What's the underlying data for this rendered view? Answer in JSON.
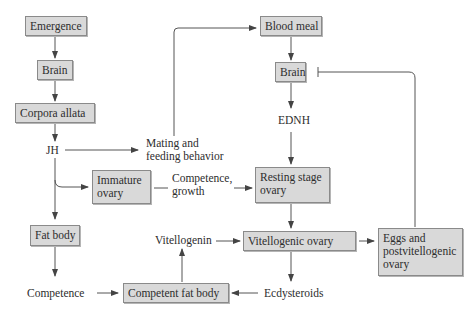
{
  "diagram": {
    "type": "flowchart",
    "boxes": {
      "emergence": "Emergence",
      "brain_left": "Brain",
      "corpora_allata": "Corpora allata",
      "fat_body": "Fat body",
      "immature_ovary": [
        "Immature",
        "ovary"
      ],
      "blood_meal": "Blood meal",
      "brain_right": "Brain",
      "resting_ovary": [
        "Resting stage",
        "ovary"
      ],
      "vitellogenic_ovary": "Vitellogenic ovary",
      "eggs": [
        "Eggs and",
        "postvitellogenic",
        "ovary"
      ],
      "competent_fat_body": "Competent fat body"
    },
    "labels": {
      "jh": "JH",
      "mating": [
        "Mating and",
        "feeding behavior"
      ],
      "ednh": "EDNH",
      "competence_growth": [
        "Competence,",
        "growth"
      ],
      "vitellogenin": "Vitellogenin",
      "competence": "Competence",
      "ecdysteroids": "Ecdysteroids"
    },
    "edges": [
      {
        "from": "Emergence",
        "to": "Brain (left)",
        "type": "arrow"
      },
      {
        "from": "Brain (left)",
        "to": "Corpora allata",
        "type": "arrow"
      },
      {
        "from": "Corpora allata",
        "to": "JH",
        "type": "arrow"
      },
      {
        "from": "JH",
        "to": "Mating and feeding behavior",
        "type": "arrow"
      },
      {
        "from": "Mating and feeding behavior",
        "to": "Blood meal",
        "type": "arrow"
      },
      {
        "from": "JH",
        "to": "Immature ovary",
        "type": "arrow"
      },
      {
        "from": "JH",
        "to": "Fat body",
        "type": "arrow"
      },
      {
        "from": "Fat body",
        "to": "Competence",
        "type": "arrow"
      },
      {
        "from": "Competence",
        "to": "Competent fat body",
        "type": "arrow"
      },
      {
        "from": "Immature ovary",
        "to": "Resting stage ovary",
        "via": "Competence, growth",
        "type": "arrow"
      },
      {
        "from": "Blood meal",
        "to": "Brain (right)",
        "type": "arrow"
      },
      {
        "from": "Brain (right)",
        "to": "EDNH",
        "type": "arrow"
      },
      {
        "from": "EDNH",
        "to": "Resting stage ovary",
        "type": "arrow"
      },
      {
        "from": "Resting stage ovary",
        "to": "Vitellogenic ovary",
        "type": "arrow"
      },
      {
        "from": "Vitellogenic ovary",
        "to": "Ecdysteroids",
        "type": "arrow"
      },
      {
        "from": "Ecdysteroids",
        "to": "Competent fat body",
        "type": "arrow"
      },
      {
        "from": "Competent fat body",
        "to": "Vitellogenin",
        "type": "arrow"
      },
      {
        "from": "Vitellogenin",
        "to": "Vitellogenic ovary",
        "type": "arrow"
      },
      {
        "from": "Vitellogenic ovary",
        "to": "Eggs and postvitellogenic ovary",
        "type": "arrow"
      },
      {
        "from": "Eggs and postvitellogenic ovary",
        "to": "Brain (right)",
        "type": "inhibition"
      }
    ],
    "colors": {
      "box_fill": "#d9d9d9",
      "box_border": "#8a8a8a",
      "line": "#444444"
    }
  }
}
